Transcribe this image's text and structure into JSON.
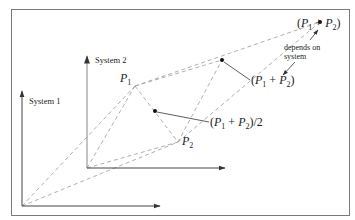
{
  "diagram": {
    "colors": {
      "frame": "#7a7a7a",
      "axes": "#444444",
      "axis_system2": "#9a9a9a",
      "dashed": "#9a9a9a",
      "text": "#222222",
      "point": "#111111",
      "background": "#ffffff"
    },
    "systems": [
      {
        "id": "system1",
        "label": "System 1"
      },
      {
        "id": "system2",
        "label": "System 2"
      }
    ],
    "points": {
      "p1": {
        "base": "P",
        "sub": "1"
      },
      "p2": {
        "base": "P",
        "sub": "2"
      }
    },
    "labels": {
      "midpoint": {
        "open": "(",
        "p": "P",
        "s1": "1",
        "plus": " + ",
        "s2": "2",
        "close": ")/2"
      },
      "sum_system2": {
        "open": "(",
        "p": "P",
        "s1": "1",
        "plus": " + ",
        "s2": "2",
        "close": ")"
      },
      "sum_system1": {
        "open": "(",
        "p": "P",
        "s1": "1",
        "plus": " + ",
        "s2": "2",
        "close": ")"
      },
      "note_line1": "depends on",
      "note_line2": "system"
    }
  }
}
